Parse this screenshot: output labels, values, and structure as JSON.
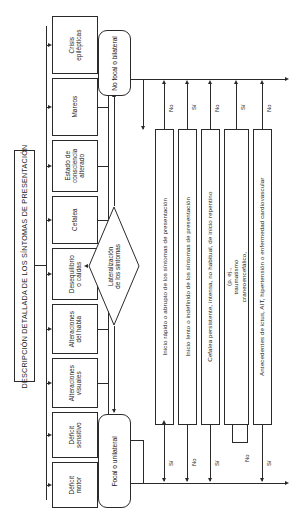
{
  "diagram": {
    "title": "DESCRIPCIÓN DETALLADA DE LOS SÍNTOMAS DE PRESENTACIÓN",
    "orientation": "rotated-90",
    "symptoms": [
      {
        "id": "crisis-epilepticas",
        "label": "Crisis\nepilépticas"
      },
      {
        "id": "mareos",
        "label": "Mareos"
      },
      {
        "id": "estado-consciencia",
        "label": "Estado de\nconsciencia\nalterado"
      },
      {
        "id": "cefalea",
        "label": "Cefalea"
      },
      {
        "id": "desequilibrio",
        "label": "Desequilibrio\no caídas"
      },
      {
        "id": "alteraciones-habla",
        "label": "Alteraciones\ndel habla"
      },
      {
        "id": "alteraciones-visuales",
        "label": "Alteraciones\nvisuales"
      },
      {
        "id": "deficit-sensitivo",
        "label": "Déficit\nsensitivo"
      },
      {
        "id": "deficit-motor",
        "label": "Déficit\nmotor"
      }
    ],
    "decision": {
      "id": "lateralizacion",
      "label": "Lateralización\nde los síntomas"
    },
    "outcomes": [
      {
        "id": "no-focal-bilateral",
        "label": "No focal o bilateral"
      },
      {
        "id": "focal-unilateral",
        "label": "Focal o unilateral"
      }
    ],
    "questions": [
      {
        "id": "inicio-rapido",
        "label": "Inicio rápido o abrupto de los síntomas de presentación",
        "top_answer": "No",
        "bottom_answer": "Sí"
      },
      {
        "id": "inicio-lento",
        "label": "Inicio lento o indefinido de los síntomas de presentación",
        "top_answer": "Sí",
        "bottom_answer": "No"
      },
      {
        "id": "cefalea-persistente",
        "label": "Cefalea persistente, intensa, no habitual, de inicio repentino",
        "top_answer": "No",
        "bottom_answer": "Sí"
      },
      {
        "id": "causa-evidente",
        "label": "Causa evidente de los síntomas (p. ej., traumatismo craneoencefálico, infecciones, drogas)",
        "top_answer": "Sí",
        "bottom_answer": "No"
      },
      {
        "id": "antecedentes",
        "label": "Antecedentes de ictus, AIT, hipertensión o enfermedad cardiovascular",
        "top_answer": "No",
        "bottom_answer": "Sí"
      }
    ]
  }
}
